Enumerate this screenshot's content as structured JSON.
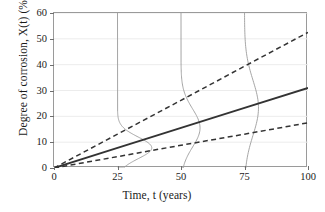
{
  "chart_data": {
    "type": "line",
    "title": "",
    "xlabel": "Time, t (years)",
    "ylabel": "Degree of corrosion, X(t) (%)",
    "xlim": [
      0,
      100
    ],
    "ylim": [
      0,
      60
    ],
    "xticks": [
      "0",
      "25",
      "50",
      "75",
      "100"
    ],
    "xtick_values": [
      0,
      25,
      50,
      75,
      100
    ],
    "yticks": [
      "0",
      "10",
      "20",
      "30",
      "40",
      "50",
      "60"
    ],
    "ytick_values": [
      0,
      10,
      20,
      30,
      40,
      50,
      60
    ],
    "grid": "horizontal",
    "legend": "none",
    "colors": {
      "mean_line": "#333333",
      "bound_line": "#333333",
      "pdf_curve": "#9b9b9b",
      "axis": "#9a9a9a",
      "grid": "#ececec",
      "background": "#ffffff"
    },
    "series": [
      {
        "name": "Upper confidence bound",
        "style": "dashed",
        "x": [
          0,
          25,
          50,
          75,
          100
        ],
        "values": [
          0,
          13.1,
          26.2,
          39.4,
          52.5
        ]
      },
      {
        "name": "Mean degree of corrosion",
        "style": "solid",
        "x": [
          0,
          25,
          50,
          75,
          100
        ],
        "values": [
          0,
          7.8,
          15.5,
          23.3,
          31.0
        ]
      },
      {
        "name": "Lower confidence bound",
        "style": "dashed",
        "x": [
          0,
          25,
          50,
          75,
          100
        ],
        "values": [
          0,
          4.4,
          8.8,
          13.1,
          17.5
        ]
      }
    ],
    "pdf_curves": [
      {
        "name": "Probability density at t = 25 years",
        "at_time": 25,
        "mean": 7.8,
        "orientation": "vertical",
        "peak_width_years": 13.5
      },
      {
        "name": "Probability density at t = 50 years",
        "at_time": 50,
        "mean": 15.5,
        "orientation": "vertical",
        "peak_width_years": 7.5
      },
      {
        "name": "Probability density at t = 75 years",
        "at_time": 75,
        "mean": 23.3,
        "orientation": "vertical",
        "peak_width_years": 5.5
      }
    ]
  }
}
